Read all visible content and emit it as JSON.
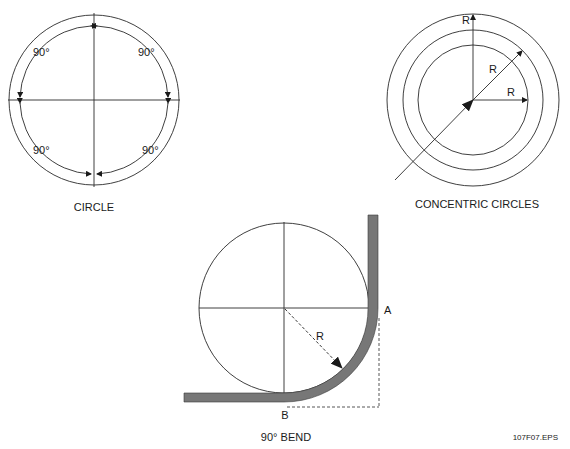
{
  "figures": {
    "circle": {
      "caption": "CIRCLE",
      "angle_labels": [
        "90°",
        "90°",
        "90°",
        "90°"
      ]
    },
    "concentric": {
      "caption": "CONCENTRIC CIRCLES",
      "radius_labels": [
        "R",
        "R",
        "R"
      ]
    },
    "bend": {
      "caption": "90° BEND",
      "radius_label": "R",
      "point_a": "A",
      "point_b": "B"
    }
  },
  "file_label": "107F07.EPS",
  "colors": {
    "line": "#2a2a2a",
    "bar": "#777777"
  }
}
